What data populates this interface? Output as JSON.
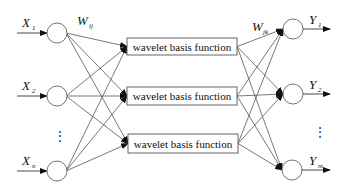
{
  "diagram": {
    "title": "",
    "inputs": [
      {
        "main": "X",
        "sub": "1",
        "cx": 57,
        "cy": 33
      },
      {
        "main": "X",
        "sub": "2",
        "cx": 57,
        "cy": 96
      },
      {
        "main": "X",
        "sub": "n",
        "cx": 57,
        "cy": 171
      }
    ],
    "input_ellipsis": "⋮",
    "hidden": [
      {
        "label": "wavelet basis function",
        "x": 127,
        "y": 38,
        "w": 110,
        "h": 17
      },
      {
        "label": "wavelet basis function",
        "x": 127,
        "y": 87,
        "w": 110,
        "h": 18
      },
      {
        "label": "wavelet basis function",
        "x": 128,
        "y": 134,
        "w": 110,
        "h": 19
      }
    ],
    "outputs": [
      {
        "main": "Y",
        "sub": "1",
        "cx": 293,
        "cy": 29
      },
      {
        "main": "Y",
        "sub": "2",
        "cx": 293,
        "cy": 94
      },
      {
        "main": "Y",
        "sub": "m",
        "cx": 292,
        "cy": 170
      }
    ],
    "output_ellipsis": "⋮",
    "weight_input_hidden": {
      "main": "W",
      "sub": "ij"
    },
    "weight_hidden_output": {
      "main": "W",
      "sub": "jk"
    },
    "colors": {
      "stroke": "#555555",
      "text": "#111111",
      "background": "#ffffff"
    }
  }
}
